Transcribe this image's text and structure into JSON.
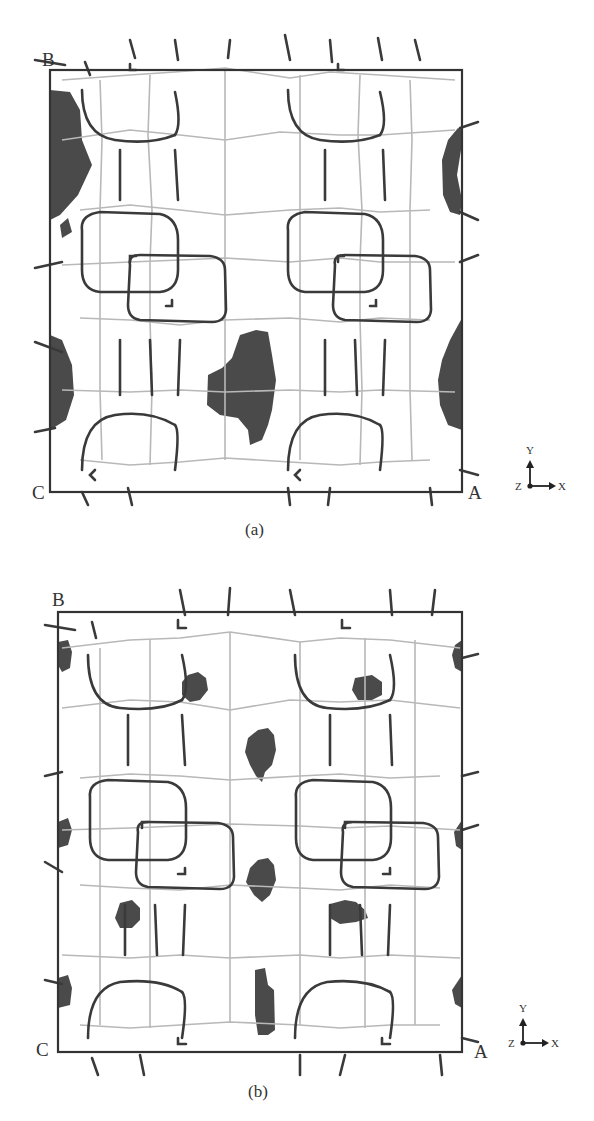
{
  "figure": {
    "panels": [
      {
        "id": "a",
        "caption": "(a)",
        "corners": {
          "top_left": "B",
          "bottom_left": "C",
          "bottom_right": "A"
        },
        "axes": {
          "up": "Y",
          "right": "X",
          "origin": "Z"
        },
        "description": "Framework unit cell projection with large dark density regions at the cell edges and one large central blob"
      },
      {
        "id": "b",
        "caption": "(b)",
        "corners": {
          "top_left": "B",
          "bottom_left": "C",
          "bottom_right": "A"
        },
        "axes": {
          "up": "Y",
          "right": "X",
          "origin": "Z"
        },
        "description": "Framework unit cell projection with multiple small dark density regions distributed in the pores"
      }
    ],
    "colors": {
      "frame": "#333333",
      "framework_dark": "#3a3a3a",
      "framework_light": "#b8b8b8",
      "density": "#4a4a4a",
      "background": "#ffffff"
    }
  }
}
